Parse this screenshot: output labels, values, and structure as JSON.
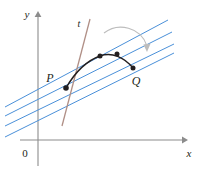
{
  "figure": {
    "background_color": "#ffffff",
    "width": 203,
    "height": 171
  },
  "axes": {
    "x_label": "x",
    "y_label": "y",
    "origin_label": "0",
    "axis_color": "#8c8c8c",
    "x_axis": {
      "y": 140,
      "x_start": 20,
      "x_end": 186
    },
    "y_axis": {
      "x": 38,
      "y_start": 13,
      "y_end": 166
    },
    "x_label_pos": {
      "x": 188,
      "y": 156
    },
    "y_label_pos": {
      "x": 27,
      "y": 17
    },
    "origin_label_pos": {
      "x": 24,
      "y": 156
    }
  },
  "curve": {
    "name": "function-curve",
    "color": "#231f20",
    "stroke_width": 1.4,
    "path": "M 66,88 C 74,74 86,61 100,56 C 112,52 124,57 133,68"
  },
  "tangent_line": {
    "name": "tangent-line-t",
    "label": "t",
    "color": "#b08f86",
    "stroke_width": 1.2,
    "label_pos": {
      "x": 79,
      "y": 26
    },
    "x1": 62,
    "y1": 126,
    "x2": 90,
    "y2": 19
  },
  "point_p": {
    "label": "P",
    "x": 66,
    "y": 88,
    "radius": 2.6,
    "color": "#231f20",
    "label_pos": {
      "x": 50,
      "y": 81
    }
  },
  "point_q": {
    "label": "Q",
    "x": 133,
    "y": 68,
    "radius": 2.4,
    "color": "#231f20",
    "label_pos": {
      "x": 134,
      "y": 84
    }
  },
  "secant_lines": {
    "color": "#4a90d9",
    "stroke_width": 1.0,
    "lines": [
      {
        "name": "secant-line-1",
        "x1": 5,
        "y1": 137,
        "x2": 174,
        "y2": 53
      },
      {
        "name": "secant-line-2",
        "x1": 5,
        "y1": 126,
        "x2": 174,
        "y2": 44
      },
      {
        "name": "secant-line-3",
        "x1": 5,
        "y1": 116,
        "x2": 172,
        "y2": 32
      },
      {
        "name": "secant-line-4",
        "x1": 5,
        "y1": 107,
        "x2": 168,
        "y2": 20
      }
    ]
  },
  "curve_points": [
    {
      "name": "curve-point-1",
      "x": 100,
      "y": 56,
      "radius": 2.4,
      "color": "#231f20"
    },
    {
      "name": "curve-point-2",
      "x": 117,
      "y": 54,
      "radius": 2.4,
      "color": "#231f20"
    }
  ],
  "motion_arc": {
    "name": "motion-arrow-arc",
    "color": "#bdbdbd",
    "stroke_width": 1.0,
    "path": "M 104,33 C 118,22 140,27 147,47",
    "arrow_tip": {
      "x": 147,
      "y": 52
    }
  }
}
